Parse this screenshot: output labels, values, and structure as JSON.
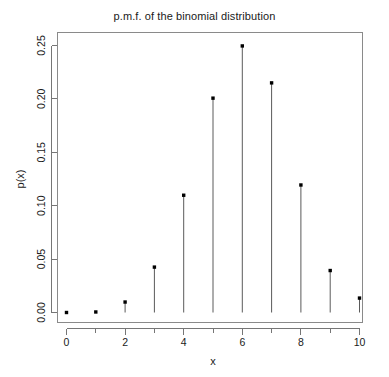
{
  "chart_data": {
    "type": "scatter",
    "title": "p.m.f. of the binomial distribution",
    "xlabel": "x",
    "ylabel": "p(x)",
    "categories": [
      0,
      1,
      2,
      3,
      4,
      5,
      6,
      7,
      8,
      9,
      10
    ],
    "x": [
      0,
      1,
      2,
      3,
      4,
      5,
      6,
      7,
      8,
      9,
      10
    ],
    "values": [
      0.0,
      0.0005,
      0.0098,
      0.0425,
      0.1098,
      0.2007,
      0.2496,
      0.215,
      0.1194,
      0.0393,
      0.0135
    ],
    "xlim": [
      0,
      10
    ],
    "ylim": [
      0.0,
      0.25
    ],
    "xticks": [
      0,
      1,
      2,
      3,
      4,
      5,
      6,
      7,
      8,
      9,
      10
    ],
    "xtick_labels": [
      "0",
      "",
      "2",
      "",
      "4",
      "",
      "6",
      "",
      "8",
      "",
      "10"
    ],
    "yticks": [
      0.0,
      0.05,
      0.1,
      0.15,
      0.2,
      0.25
    ],
    "ytick_labels": [
      "0.00",
      "0.05",
      "0.10",
      "0.15",
      "0.20",
      "0.25"
    ],
    "grid": false,
    "legend": null,
    "marker": "filled-square-point",
    "style": "stem-plot",
    "point_color": "#000000",
    "stem_color": "#5a5a5a",
    "axis_color": "#767676",
    "background": "#ffffff"
  },
  "axes": {
    "y_tick_labels": [
      "0.00",
      "0.05",
      "0.10",
      "0.15",
      "0.20",
      "0.25"
    ],
    "x_tick_labels": [
      "0",
      "2",
      "4",
      "6",
      "8",
      "10"
    ],
    "x_axis_title": "x",
    "y_axis_title": "p(x)"
  },
  "header": {
    "title": "p.m.f. of the binomial distribution"
  }
}
